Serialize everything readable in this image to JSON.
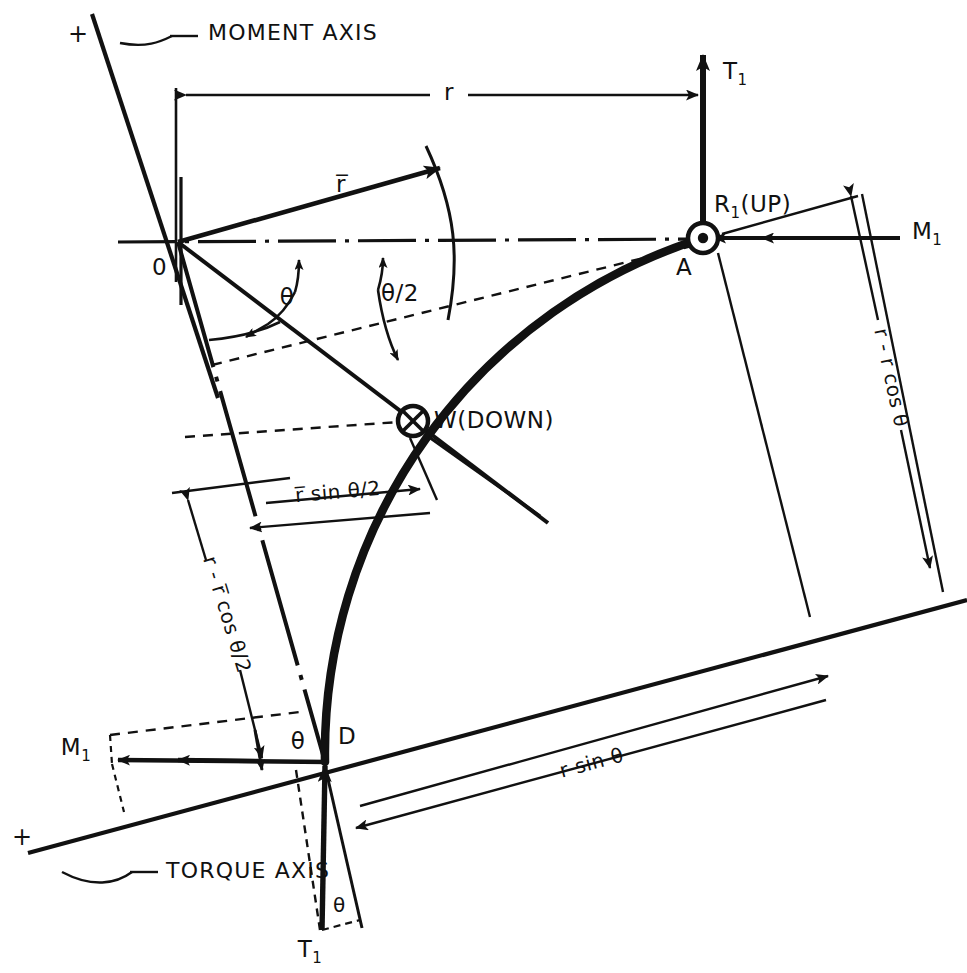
{
  "figure": {
    "background_color": "#ffffff",
    "line_color": "#111111"
  },
  "axes": [
    {
      "id": "moment-axis",
      "label": "MOMENT AXIS",
      "sign_label": "+"
    },
    {
      "id": "torque-axis",
      "label": "TORQUE AXIS",
      "sign_label": "+"
    }
  ],
  "points": [
    {
      "id": "O",
      "label": "0",
      "x": 178,
      "y": 242,
      "marker": "none"
    },
    {
      "id": "A",
      "label": "A",
      "x": 703,
      "y": 238,
      "marker": "circle-dot"
    },
    {
      "id": "D",
      "label": "D",
      "x": 325,
      "y": 762,
      "marker": "none"
    },
    {
      "id": "W",
      "label": "W(DOWN)",
      "x": 413,
      "y": 421,
      "marker": "circle-cross"
    }
  ],
  "forces": [
    {
      "id": "T1-top",
      "label": "T",
      "subscript": "1",
      "direction": "up",
      "at": "A"
    },
    {
      "id": "T1-bottom",
      "label": "T",
      "subscript": "1",
      "direction": "up",
      "at": "D"
    },
    {
      "id": "M1-right",
      "label": "M",
      "subscript": "1",
      "direction": "left",
      "at": "A",
      "style": "double-arrow"
    },
    {
      "id": "M1-left",
      "label": "M",
      "subscript": "1",
      "direction": "left",
      "at": "D",
      "style": "double-arrow"
    },
    {
      "id": "R1",
      "label": "R",
      "subscript": "1",
      "suffix": "(UP)",
      "at": "A"
    },
    {
      "id": "W",
      "label": "W(DOWN)",
      "at": "W",
      "direction": "down"
    }
  ],
  "dimensions": [
    {
      "id": "r",
      "label": "r",
      "orientation": "horizontal-top"
    },
    {
      "id": "r-bar",
      "label": "r̅",
      "orientation": "radial"
    },
    {
      "id": "r-minus-r-cos-theta",
      "label": "r - r cos θ",
      "orientation": "vertical-right"
    },
    {
      "id": "r-minus-rbar-cos-theta-over-2",
      "label": "r - r̅ cos θ/2",
      "orientation": "vertical-left"
    },
    {
      "id": "rbar-sin-theta-over-2",
      "label": "r̅ sin θ/2",
      "orientation": "horizontal-mid"
    },
    {
      "id": "r-sin-theta",
      "label": "r sin θ",
      "orientation": "horizontal-bottom"
    }
  ],
  "angles": [
    {
      "id": "theta-main",
      "label": "θ"
    },
    {
      "id": "theta-half",
      "label": "θ/2"
    },
    {
      "id": "theta-at-D",
      "label": "θ"
    },
    {
      "id": "theta-at-T1",
      "label": "θ"
    }
  ],
  "markers": {
    "circle_dot": "force-out-of-page",
    "circle_cross": "force-into-page"
  }
}
